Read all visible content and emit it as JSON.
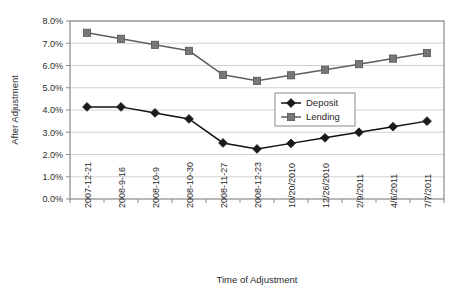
{
  "chart_data": {
    "type": "line",
    "title": "",
    "xlabel": "Time of Adjustment",
    "ylabel": "After Adjustment",
    "categories": [
      "2007-12-21",
      "2008-9-16",
      "2008-10-9",
      "2008-10-30",
      "2008-11-27",
      "2008-12-23",
      "10/20/2010",
      "12/26/2010",
      "2/9/2011",
      "4/6/2011",
      "7/7/2011"
    ],
    "series": [
      {
        "name": "Deposit",
        "marker": "diamond",
        "color": "#1a1a1a",
        "values": [
          4.14,
          4.14,
          3.87,
          3.6,
          2.52,
          2.25,
          2.5,
          2.75,
          3.0,
          3.25,
          3.5
        ]
      },
      {
        "name": "Lending",
        "marker": "square",
        "color": "#777777",
        "values": [
          7.47,
          7.2,
          6.93,
          6.66,
          5.58,
          5.31,
          5.56,
          5.81,
          6.06,
          6.31,
          6.56
        ]
      }
    ],
    "ylim": [
      0.0,
      8.0
    ],
    "ytick_step": 1.0,
    "ytick_labels": [
      "0.0%",
      "1.0%",
      "2.0%",
      "3.0%",
      "4.0%",
      "5.0%",
      "6.0%",
      "7.0%",
      "8.0%"
    ],
    "grid": true,
    "grid_axis": "y",
    "legend_position": "center-right",
    "value_unit": "%"
  },
  "legend": {
    "entries": [
      {
        "label": "Deposit"
      },
      {
        "label": "Lending"
      }
    ]
  },
  "axes": {
    "x_title": "Time of Adjustment",
    "y_title": "After Adjustment"
  }
}
